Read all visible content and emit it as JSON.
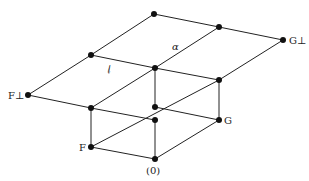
{
  "diagram": {
    "type": "lattice",
    "nodes": [
      {
        "id": "top",
        "label": ""
      },
      {
        "id": "p",
        "label": ""
      },
      {
        "id": "q",
        "label": ""
      },
      {
        "id": "g_perp",
        "label": "G⊥"
      },
      {
        "id": "f_perp",
        "label": "F⊥"
      },
      {
        "id": "c",
        "label": ""
      },
      {
        "id": "r",
        "label": ""
      },
      {
        "id": "d",
        "label": ""
      },
      {
        "id": "m",
        "label": ""
      },
      {
        "id": "e",
        "label": ""
      },
      {
        "id": "g",
        "label": "G"
      },
      {
        "id": "f",
        "label": "F"
      },
      {
        "id": "zero",
        "label": "(0)"
      }
    ],
    "edges": [
      [
        "f_perp",
        "p"
      ],
      [
        "p",
        "top"
      ],
      [
        "top",
        "q"
      ],
      [
        "q",
        "g_perp"
      ],
      [
        "p",
        "c"
      ],
      [
        "c",
        "q"
      ],
      [
        "c",
        "r"
      ],
      [
        "r",
        "g_perp"
      ],
      [
        "f_perp",
        "d"
      ],
      [
        "d",
        "c"
      ],
      [
        "d",
        "e"
      ],
      [
        "m",
        "g"
      ],
      [
        "c",
        "m"
      ],
      [
        "r",
        "g"
      ],
      [
        "d",
        "f"
      ],
      [
        "e",
        "zero"
      ],
      [
        "f",
        "r"
      ],
      [
        "f",
        "zero"
      ],
      [
        "zero",
        "g"
      ]
    ],
    "region_labels": {
      "script_l": "𝓁",
      "alpha": "α"
    }
  }
}
